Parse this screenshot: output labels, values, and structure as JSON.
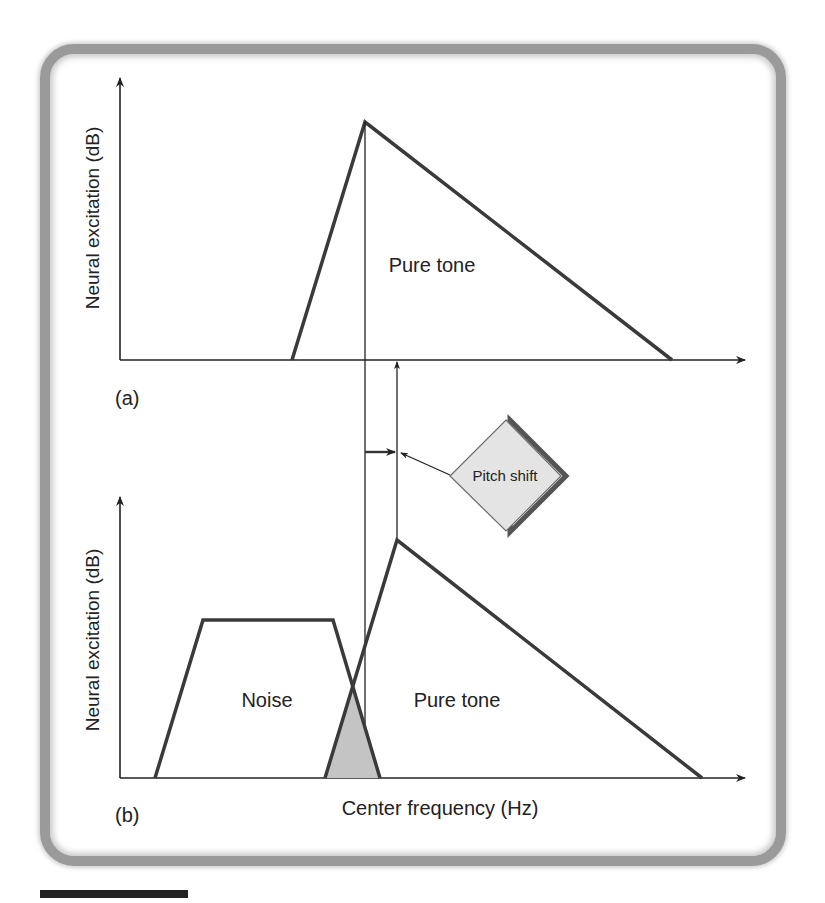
{
  "figure": {
    "panel_a": {
      "tag": "(a)",
      "y_axis_label": "Neural excitation (dB)",
      "curve_label": "Pure tone"
    },
    "panel_b": {
      "tag": "(b)",
      "y_axis_label": "Neural excitation (dB)",
      "noise_label": "Noise",
      "curve_label": "Pure tone",
      "x_axis_label": "Center frequency (Hz)"
    },
    "callout": {
      "label": "Pitch shift"
    }
  },
  "colors": {
    "line": "#3a3a3a",
    "overlap_fill": "#c4c4c4",
    "callout_fill": "#e4e4e4",
    "callout_shadow": "#555555",
    "frame": "#9a9a9a"
  }
}
